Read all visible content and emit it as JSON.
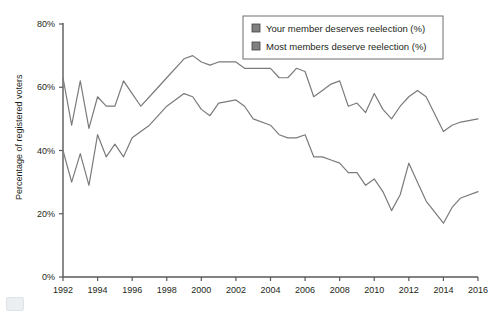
{
  "chart_data": {
    "type": "line",
    "title": "",
    "xlabel": "",
    "ylabel": "Percentage of registered voters",
    "xlim": [
      1992,
      2016
    ],
    "ylim": [
      0,
      80
    ],
    "grid": false,
    "legend_position": "top-right",
    "x_ticks": [
      "1992",
      "1994",
      "1996",
      "1998",
      "2000",
      "2002",
      "2004",
      "2006",
      "2008",
      "2010",
      "2012",
      "2014",
      "2016"
    ],
    "y_ticks": [
      "0%",
      "20%",
      "40%",
      "60%",
      "80%"
    ],
    "x": [
      1992,
      1992.5,
      1993,
      1993.5,
      1994,
      1994.5,
      1995,
      1995.5,
      1996,
      1996.5,
      1997,
      1998,
      1999,
      1999.5,
      2000,
      2000.5,
      2001,
      2002,
      2002.5,
      2003,
      2004,
      2004.5,
      2005,
      2005.5,
      2006,
      2006.5,
      2007,
      2007.5,
      2008,
      2008.5,
      2009,
      2009.5,
      2010,
      2010.5,
      2011,
      2011.5,
      2012,
      2012.5,
      2013,
      2014,
      2014.5,
      2015,
      2016
    ],
    "series": [
      {
        "name": "Your member deserves reelection (%)",
        "color": "#7b7b7b",
        "values": [
          63,
          48,
          62,
          47,
          57,
          54,
          54,
          62,
          58,
          54,
          57,
          63,
          69,
          70,
          68,
          67,
          68,
          68,
          66,
          66,
          66,
          63,
          63,
          66,
          65,
          57,
          59,
          61,
          62,
          54,
          55,
          52,
          58,
          53,
          50,
          54,
          57,
          59,
          57,
          46,
          48,
          49,
          50
        ]
      },
      {
        "name": "Most members deserve reelection (%)",
        "color": "#7b7b7b",
        "values": [
          40,
          30,
          39,
          29,
          45,
          38,
          42,
          38,
          44,
          46,
          48,
          54,
          58,
          57,
          53,
          51,
          55,
          56,
          54,
          50,
          48,
          45,
          44,
          44,
          45,
          38,
          38,
          37,
          36,
          33,
          33,
          29,
          31,
          27,
          21,
          26,
          36,
          30,
          24,
          17,
          22,
          25,
          27
        ]
      }
    ]
  },
  "legend": {
    "entries": [
      {
        "label": "Your member deserves reelection (%)",
        "swatch": "#808080"
      },
      {
        "label": "Most members deserve reelection (%)",
        "swatch": "#808080"
      }
    ]
  },
  "axis": {
    "y_title": "Percentage of registered voters"
  }
}
